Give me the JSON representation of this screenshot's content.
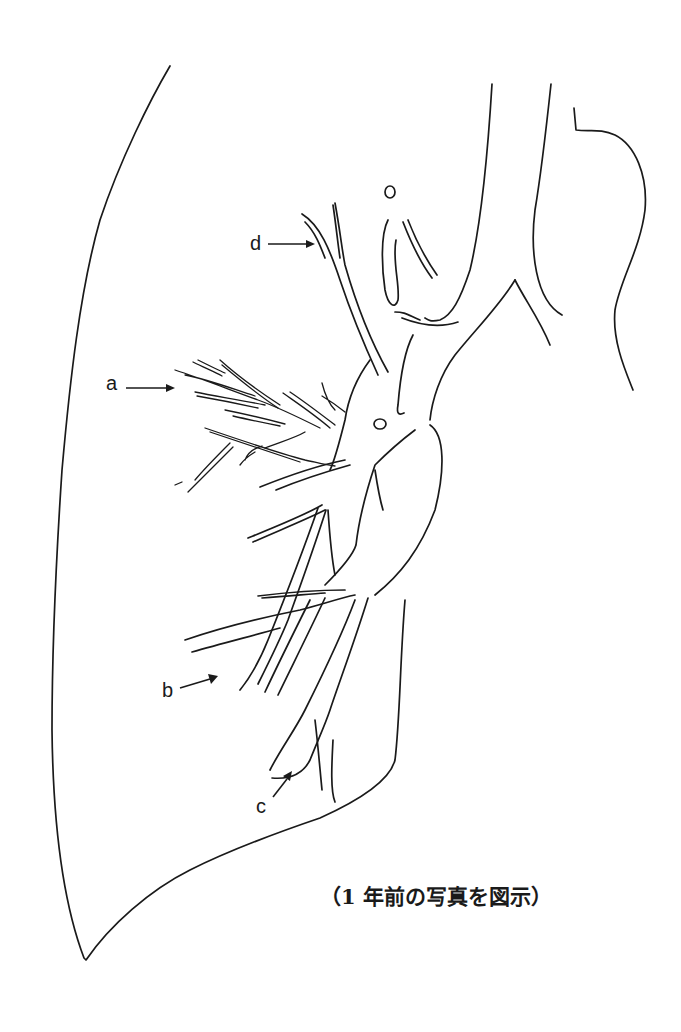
{
  "figure": {
    "type": "lung-vessel-line-drawing",
    "stroke_color": "#1a1a1a",
    "background": "#ffffff",
    "labels": [
      {
        "id": "a",
        "text": "a",
        "arrow_direction": "right"
      },
      {
        "id": "b",
        "text": "b",
        "arrow_direction": "up-right"
      },
      {
        "id": "c",
        "text": "c",
        "arrow_direction": "up-right"
      },
      {
        "id": "d",
        "text": "d",
        "arrow_direction": "right"
      }
    ],
    "caption": "（1 年前の写真を図示）"
  }
}
